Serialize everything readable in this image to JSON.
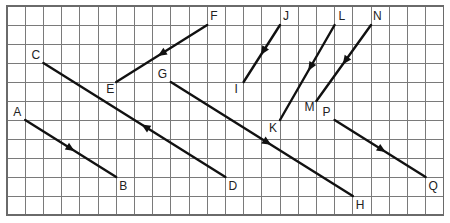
{
  "diagram": {
    "type": "grid-vectors",
    "grid": {
      "columns": 24,
      "rows": 11,
      "origin_px": [
        7,
        6
      ],
      "cell_width_px": 18.2,
      "cell_height_px": 19.0,
      "line_color": "#7a7a7a"
    },
    "points": {
      "A": [
        1,
        6
      ],
      "B": [
        6,
        9
      ],
      "C": [
        2,
        3
      ],
      "D": [
        12,
        9
      ],
      "E": [
        6,
        4
      ],
      "F": [
        11,
        1
      ],
      "G": [
        9,
        4
      ],
      "H": [
        19,
        10
      ],
      "I": [
        13,
        4
      ],
      "J": [
        15,
        1
      ],
      "K": [
        15,
        6
      ],
      "L": [
        18,
        1
      ],
      "M": [
        17,
        5
      ],
      "N": [
        20,
        1
      ],
      "P": [
        18,
        6
      ],
      "Q": [
        23,
        9
      ]
    },
    "label_offsets": {
      "A": [
        -12,
        -4
      ],
      "B": [
        3,
        13
      ],
      "C": [
        -12,
        -4
      ],
      "D": [
        3,
        13
      ],
      "E": [
        -10,
        11
      ],
      "F": [
        3,
        -5
      ],
      "G": [
        -13,
        -4
      ],
      "H": [
        3,
        13
      ],
      "I": [
        -9,
        11
      ],
      "J": [
        3,
        -5
      ],
      "K": [
        -11,
        12
      ],
      "L": [
        4,
        -5
      ],
      "M": [
        -12,
        10
      ],
      "N": [
        2,
        -5
      ],
      "P": [
        -12,
        -4
      ],
      "Q": [
        3,
        13
      ]
    },
    "vectors": [
      {
        "from": "A",
        "to": "B",
        "arrow_at": 0.5
      },
      {
        "from": "D",
        "to": "C",
        "arrow_at": 0.44
      },
      {
        "from": "F",
        "to": "E",
        "arrow_at": 0.5
      },
      {
        "from": "G",
        "to": "H",
        "arrow_at": 0.53
      },
      {
        "from": "J",
        "to": "I",
        "arrow_at": 0.46
      },
      {
        "from": "L",
        "to": "K",
        "arrow_at": 0.44
      },
      {
        "from": "N",
        "to": "M",
        "arrow_at": 0.47
      },
      {
        "from": "P",
        "to": "Q",
        "arrow_at": 0.52
      }
    ],
    "line_color": "#111111"
  }
}
